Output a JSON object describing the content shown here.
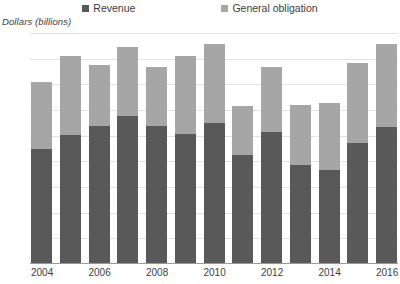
{
  "chart_data": {
    "type": "bar",
    "stacked": true,
    "title": "",
    "subtitle": "",
    "xlabel": "",
    "ylabel": "Dollars (billions)",
    "ylim": [
      0,
      450
    ],
    "ytick_step": 50,
    "yticks": [
      "450",
      "400",
      "350",
      "300",
      "250",
      "200",
      "150",
      "100",
      "50",
      "0"
    ],
    "grid": true,
    "legend_position": "top",
    "categories": [
      "2004",
      "2005",
      "2006",
      "2007",
      "2008",
      "2009",
      "2010",
      "2011",
      "2012",
      "2013",
      "2014",
      "2015",
      "2016"
    ],
    "xtick_labels": [
      "2004",
      "",
      "2006",
      "",
      "2008",
      "",
      "2010",
      "",
      "2012",
      "",
      "2014",
      "",
      "2016"
    ],
    "series": [
      {
        "name": "Revenue",
        "color": "#595959",
        "values": [
          225,
          252,
          268,
          288,
          268,
          253,
          275,
          212,
          257,
          192,
          184,
          235,
          266
        ]
      },
      {
        "name": "General obligation",
        "color": "#a6a6a6",
        "values": [
          130,
          153,
          120,
          135,
          116,
          152,
          154,
          95,
          126,
          118,
          129,
          157,
          163
        ]
      }
    ],
    "totals": [
      355,
      405,
      388,
      423,
      384,
      405,
      429,
      307,
      383,
      310,
      313,
      392,
      429
    ]
  },
  "legend": {
    "items": [
      {
        "label": "Revenue",
        "color": "#595959"
      },
      {
        "label": "General obligation",
        "color": "#a6a6a6"
      }
    ]
  },
  "axis": {
    "y_title": "Dollars (billions)"
  },
  "colors": {
    "revenue": "#595959",
    "general_obligation": "#a6a6a6",
    "gridline": "#e2e2e2",
    "axis": "#9a9a9a",
    "text": "#3c3c3c",
    "background": "#ffffff"
  }
}
